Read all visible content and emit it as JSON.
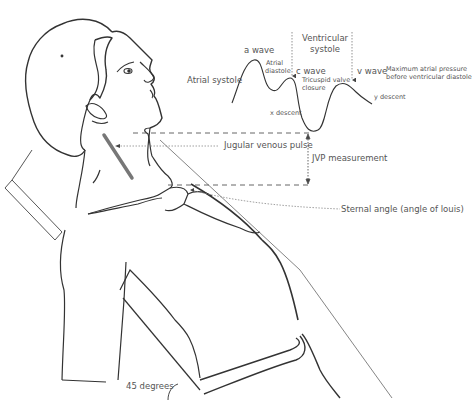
{
  "figure": {
    "waveform": {
      "labels": {
        "a_wave": "a wave",
        "atrial_systole": "Atrial systole",
        "atrial_diastole_line1": "Atrial",
        "atrial_diastole_line2": "diastole",
        "c_wave": "c wave",
        "tricuspid_line1": "Tricuspid valve",
        "tricuspid_line2": "closure",
        "ventricular_line1": "Ventricular",
        "ventricular_line2": "systole",
        "v_wave": "v wave",
        "max_pressure_line1": "Maximum atrial pressure",
        "max_pressure_line2": "before ventricular diastole",
        "x_descent": "x descent",
        "y_descent": "y descent"
      }
    },
    "annotations": {
      "jvp_pulse": "Jugular venous pulse",
      "jvp_measurement": "JVP measurement",
      "sternal_angle": "Sternal angle (angle of louis)",
      "angle": "45 degrees"
    },
    "colors": {
      "line": "#333333",
      "text": "#555555",
      "dotted": "#777777"
    }
  }
}
